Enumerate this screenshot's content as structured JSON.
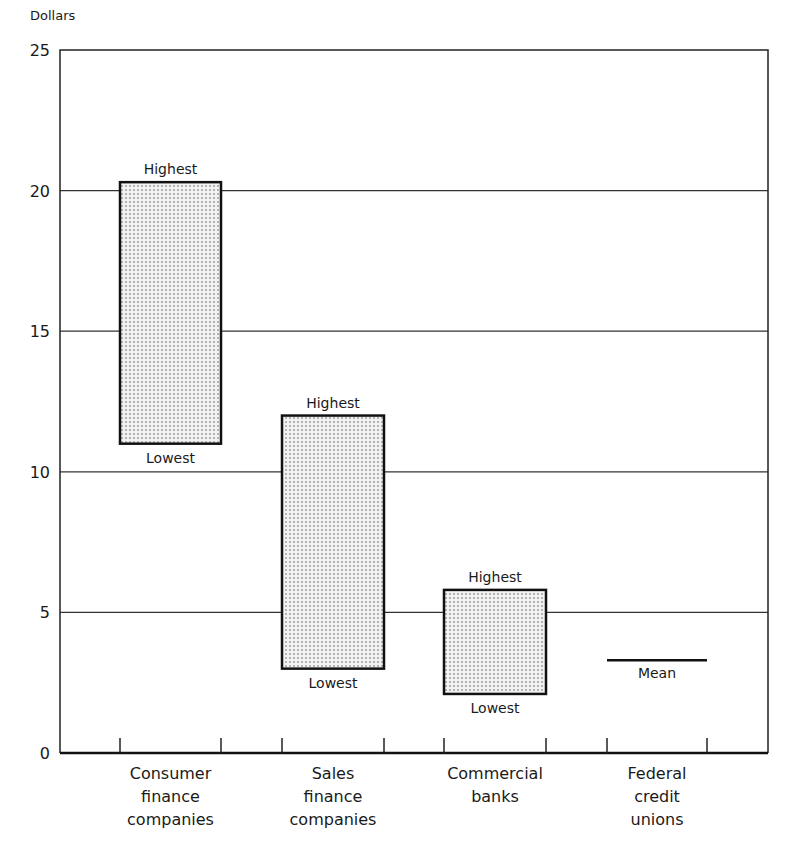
{
  "chart_data": {
    "type": "bar",
    "subtype": "floating-range",
    "title": "",
    "ylabel": "Dollars",
    "xlabel": "",
    "ylim": [
      0,
      25
    ],
    "yticks": [
      0,
      5,
      10,
      15,
      20,
      25
    ],
    "grid": true,
    "legend": null,
    "categories": [
      [
        "Consumer",
        "finance",
        "companies"
      ],
      [
        "Sales",
        "finance",
        "companies"
      ],
      [
        "Commercial",
        "banks"
      ],
      [
        "Federal",
        "credit",
        "unions"
      ]
    ],
    "series": [
      {
        "name": "Range",
        "values": [
          {
            "category": "Consumer finance companies",
            "lowest": 11.0,
            "highest": 20.3
          },
          {
            "category": "Sales finance companies",
            "lowest": 3.0,
            "highest": 12.0
          },
          {
            "category": "Commercial banks",
            "lowest": 2.1,
            "highest": 5.8
          },
          {
            "category": "Federal credit unions",
            "mean": 3.3
          }
        ]
      }
    ],
    "annotations": {
      "highest": "Highest",
      "lowest": "Lowest",
      "mean": "Mean"
    }
  }
}
